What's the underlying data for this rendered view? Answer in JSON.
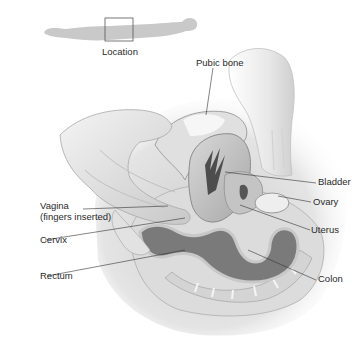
{
  "diagram": {
    "type": "anatomical illustration",
    "locator": {
      "label": "Location"
    },
    "labels": {
      "pubic_bone": "Pubic bone",
      "bladder": "Bladder",
      "ovary": "Ovary",
      "vagina_line1": "Vagina",
      "vagina_line2": "(fingers inserted)",
      "uterus": "Uterus",
      "cervix": "Cervix",
      "rectum": "Rectum",
      "colon": "Colon"
    },
    "colors": {
      "background": "#ffffff",
      "silhouette": "#c9c9c9",
      "tissue_light": "#e6e6e6",
      "tissue_mid": "#bdbdbd",
      "tissue_dark": "#6e6e6e",
      "leader_line": "#333333",
      "label_text": "#2a2a2a"
    }
  }
}
